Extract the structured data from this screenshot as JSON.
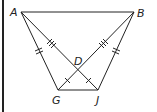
{
  "figure": {
    "type": "geometry-diagram",
    "points": {
      "A": {
        "label": "A",
        "x": 21,
        "y": 12
      },
      "B": {
        "label": "B",
        "x": 134,
        "y": 12
      },
      "G": {
        "label": "G",
        "x": 58,
        "y": 90
      },
      "J": {
        "label": "J",
        "x": 98,
        "y": 90
      },
      "D": {
        "label": "D",
        "x": 78,
        "y": 70
      }
    },
    "segments": [
      "AB",
      "AG",
      "AJ",
      "BG",
      "BJ",
      "GJ"
    ],
    "congruence_marks": {
      "single": [
        "AG",
        "BJ"
      ],
      "double": [
        "AD",
        "BD"
      ],
      "single_small": [
        "DG",
        "DJ"
      ]
    },
    "stroke_color": "#222222"
  }
}
